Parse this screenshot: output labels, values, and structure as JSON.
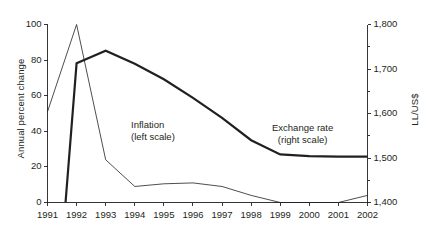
{
  "chart_data": {
    "type": "line",
    "title": "",
    "xlabel": "",
    "x": [
      1991,
      1992,
      1993,
      1994,
      1995,
      1996,
      1997,
      1998,
      1999,
      2000,
      2001,
      2002
    ],
    "categories": [
      "1991",
      "1992",
      "1993",
      "1994",
      "1995",
      "1996",
      "1997",
      "1998",
      "1999",
      "2000",
      "2001",
      "2002"
    ],
    "grid": false,
    "legend_position": "inline-annotations",
    "axes": {
      "left": {
        "label": "Annual percent change",
        "min": 0,
        "max": 100,
        "ticks": [
          0,
          20,
          40,
          60,
          80,
          100
        ],
        "tick_labels": [
          "0",
          "20",
          "40",
          "60",
          "80",
          "100"
        ],
        "minor_ticks": []
      },
      "right": {
        "label": "LL/US$",
        "min": 1400,
        "max": 1800,
        "ticks": [
          1400,
          1500,
          1600,
          1700,
          1800
        ],
        "tick_labels": [
          "1,400",
          "1,500",
          "1,600",
          "1,700",
          "1,800"
        ],
        "minor_ticks": [
          1450,
          1550,
          1650,
          1750
        ]
      },
      "x": {
        "min": 1991,
        "max": 2002,
        "ticks": [
          1991,
          1992,
          1993,
          1994,
          1995,
          1996,
          1997,
          1998,
          1999,
          2000,
          2001,
          2002
        ]
      }
    },
    "series": [
      {
        "name": "Inflation",
        "axis": "left",
        "note_line1": "Inflation",
        "note_line2": "(left scale)",
        "stroke_width": 0.8,
        "color": "#231f20",
        "x": [
          1991,
          1992,
          1993,
          1994,
          1995,
          1996,
          1997,
          1998,
          1999,
          2000,
          2001,
          2002
        ],
        "values": [
          51,
          100,
          24,
          9,
          10.5,
          11,
          9,
          4,
          0,
          0,
          0,
          4
        ]
      },
      {
        "name": "Exchange rate",
        "axis": "right",
        "note_line1": "Exchange rate",
        "note_line2": "(right scale)",
        "stroke_width": 2.2,
        "color": "#231f20",
        "x": [
          1991.62,
          1992,
          1993,
          1994,
          1995,
          1996,
          1997,
          1998,
          1999,
          2000,
          2001,
          2002
        ],
        "values": [
          1400,
          1713,
          1741,
          1712,
          1677,
          1635,
          1590,
          1540,
          1508,
          1504,
          1503,
          1503
        ]
      }
    ]
  },
  "colors": {
    "ink": "#231f20",
    "background": "#ffffff"
  }
}
